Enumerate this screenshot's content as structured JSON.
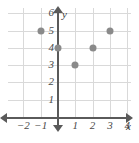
{
  "chart_data": {
    "type": "scatter",
    "title": "",
    "subtitle": "",
    "xlabel": "x",
    "ylabel": "y",
    "xlim": [
      -2.5,
      4.5
    ],
    "ylim": [
      -0.8,
      6.8
    ],
    "grid": true,
    "legend": null,
    "x_ticks": [
      {
        "value": -2,
        "label": "−2"
      },
      {
        "value": -1,
        "label": "−1"
      },
      {
        "value": 1,
        "label": "1"
      },
      {
        "value": 2,
        "label": "2"
      },
      {
        "value": 3,
        "label": "3"
      },
      {
        "value": 4,
        "label": "4"
      }
    ],
    "y_ticks": [
      {
        "value": 1,
        "label": "1"
      },
      {
        "value": 2,
        "label": "2"
      },
      {
        "value": 3,
        "label": "3"
      },
      {
        "value": 4,
        "label": "4"
      },
      {
        "value": 5,
        "label": "5"
      },
      {
        "value": 6,
        "label": "6"
      }
    ],
    "points": [
      {
        "x": -1,
        "y": 5,
        "label": "(−1, 5)"
      },
      {
        "x": 0,
        "y": 4,
        "label": "(0, 4)"
      },
      {
        "x": 1,
        "y": 3,
        "label": "(1, 3)"
      },
      {
        "x": 2,
        "y": 4,
        "label": "(2, 4)"
      },
      {
        "x": 3,
        "y": 5,
        "label": "(3, 5)"
      }
    ],
    "x": [
      -1,
      0,
      1,
      2,
      3
    ],
    "values": [
      5,
      4,
      3,
      4,
      5
    ],
    "colors": {
      "point": "#8a8a8a",
      "axis": "#5a5a5a",
      "grid": "#d9d9d9",
      "label": "#4a4a4a",
      "background": "#ffffff"
    }
  }
}
